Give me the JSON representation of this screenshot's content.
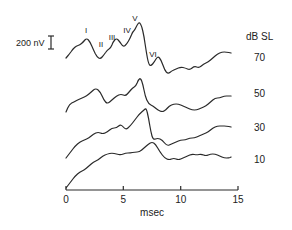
{
  "chart_data": {
    "type": "line",
    "title": "",
    "xlabel": "msec",
    "ylabel": "",
    "xlim": [
      0,
      15
    ],
    "x_ticks": [
      0,
      5,
      10,
      15
    ],
    "x_tick_labels": [
      "0",
      "5",
      "10",
      "15"
    ],
    "grid": false,
    "scale_bar": {
      "label": "200 nV",
      "value_nV": 200
    },
    "legend_title": "dB SL",
    "series": [
      {
        "name": "70",
        "level_db_sl": 70,
        "points": [
          [
            0.0,
            58
          ],
          [
            0.3,
            54
          ],
          [
            0.6,
            49
          ],
          [
            0.9,
            46
          ],
          [
            1.2,
            45
          ],
          [
            1.5,
            42
          ],
          [
            1.8,
            38
          ],
          [
            2.1,
            42
          ],
          [
            2.4,
            50
          ],
          [
            2.7,
            57
          ],
          [
            3.0,
            59
          ],
          [
            3.3,
            55
          ],
          [
            3.6,
            50
          ],
          [
            3.9,
            48
          ],
          [
            4.1,
            42
          ],
          [
            4.4,
            38
          ],
          [
            4.7,
            42
          ],
          [
            5.0,
            47
          ],
          [
            5.3,
            44
          ],
          [
            5.6,
            38
          ],
          [
            5.8,
            32
          ],
          [
            6.0,
            30
          ],
          [
            6.2,
            25
          ],
          [
            6.4,
            22
          ],
          [
            6.6,
            26
          ],
          [
            6.8,
            36
          ],
          [
            7.0,
            52
          ],
          [
            7.2,
            64
          ],
          [
            7.4,
            66
          ],
          [
            7.7,
            62
          ],
          [
            8.0,
            56
          ],
          [
            8.3,
            60
          ],
          [
            8.6,
            70
          ],
          [
            8.9,
            74
          ],
          [
            9.2,
            71
          ],
          [
            9.6,
            69
          ],
          [
            10.0,
            67
          ],
          [
            10.4,
            68
          ],
          [
            10.8,
            70
          ],
          [
            11.2,
            66
          ],
          [
            11.6,
            68
          ],
          [
            12.0,
            64
          ],
          [
            12.4,
            62
          ],
          [
            12.8,
            58
          ],
          [
            13.2,
            54
          ],
          [
            13.6,
            52
          ],
          [
            14.0,
            52
          ],
          [
            14.4,
            53
          ]
        ]
      },
      {
        "name": "50",
        "level_db_sl": 50,
        "points": [
          [
            0.0,
            112
          ],
          [
            0.3,
            104
          ],
          [
            0.7,
            102
          ],
          [
            1.0,
            100
          ],
          [
            1.4,
            98
          ],
          [
            1.8,
            96
          ],
          [
            2.2,
            92
          ],
          [
            2.6,
            88
          ],
          [
            3.0,
            92
          ],
          [
            3.3,
            100
          ],
          [
            3.6,
            104
          ],
          [
            4.0,
            100
          ],
          [
            4.4,
            96
          ],
          [
            4.8,
            94
          ],
          [
            5.2,
            96
          ],
          [
            5.5,
            92
          ],
          [
            5.8,
            88
          ],
          [
            6.1,
            86
          ],
          [
            6.3,
            80
          ],
          [
            6.5,
            78
          ],
          [
            6.7,
            84
          ],
          [
            6.9,
            96
          ],
          [
            7.2,
            104
          ],
          [
            7.6,
            106
          ],
          [
            8.0,
            110
          ],
          [
            8.4,
            112
          ],
          [
            8.7,
            110
          ],
          [
            9.0,
            106
          ],
          [
            9.4,
            104
          ],
          [
            9.8,
            104
          ],
          [
            10.2,
            106
          ],
          [
            10.6,
            108
          ],
          [
            11.0,
            110
          ],
          [
            11.4,
            110
          ],
          [
            11.8,
            108
          ],
          [
            12.2,
            106
          ],
          [
            12.6,
            102
          ],
          [
            13.0,
            98
          ],
          [
            13.4,
            98
          ],
          [
            13.8,
            96
          ],
          [
            14.2,
            96
          ],
          [
            14.4,
            96
          ]
        ]
      },
      {
        "name": "30",
        "level_db_sl": 30,
        "points": [
          [
            0.0,
            158
          ],
          [
            0.4,
            152
          ],
          [
            0.8,
            146
          ],
          [
            1.2,
            142
          ],
          [
            1.6,
            140
          ],
          [
            2.0,
            138
          ],
          [
            2.4,
            134
          ],
          [
            2.8,
            132
          ],
          [
            3.2,
            134
          ],
          [
            3.6,
            132
          ],
          [
            4.0,
            128
          ],
          [
            4.4,
            128
          ],
          [
            4.8,
            124
          ],
          [
            5.2,
            130
          ],
          [
            5.6,
            126
          ],
          [
            6.0,
            120
          ],
          [
            6.4,
            114
          ],
          [
            6.8,
            110
          ],
          [
            7.0,
            108
          ],
          [
            7.2,
            118
          ],
          [
            7.4,
            132
          ],
          [
            7.6,
            140
          ],
          [
            8.0,
            138
          ],
          [
            8.4,
            140
          ],
          [
            8.8,
            146
          ],
          [
            9.2,
            144
          ],
          [
            9.6,
            142
          ],
          [
            10.0,
            140
          ],
          [
            10.4,
            140
          ],
          [
            10.8,
            138
          ],
          [
            11.2,
            138
          ],
          [
            11.6,
            136
          ],
          [
            12.0,
            134
          ],
          [
            12.4,
            132
          ],
          [
            12.8,
            128
          ],
          [
            13.2,
            126
          ],
          [
            13.6,
            126
          ],
          [
            14.0,
            126
          ],
          [
            14.4,
            127
          ]
        ]
      },
      {
        "name": "10",
        "level_db_sl": 10,
        "points": [
          [
            0.0,
            188
          ],
          [
            0.4,
            182
          ],
          [
            0.8,
            176
          ],
          [
            1.2,
            172
          ],
          [
            1.6,
            170
          ],
          [
            2.0,
            166
          ],
          [
            2.4,
            162
          ],
          [
            2.8,
            160
          ],
          [
            3.2,
            156
          ],
          [
            3.6,
            154
          ],
          [
            4.0,
            153
          ],
          [
            4.4,
            154
          ],
          [
            4.8,
            155
          ],
          [
            5.2,
            153
          ],
          [
            5.6,
            153
          ],
          [
            6.0,
            152
          ],
          [
            6.4,
            152
          ],
          [
            6.8,
            148
          ],
          [
            7.2,
            144
          ],
          [
            7.5,
            142
          ],
          [
            7.8,
            144
          ],
          [
            8.2,
            152
          ],
          [
            8.6,
            158
          ],
          [
            9.0,
            160
          ],
          [
            9.4,
            158
          ],
          [
            9.8,
            160
          ],
          [
            10.2,
            158
          ],
          [
            10.6,
            156
          ],
          [
            11.0,
            154
          ],
          [
            11.4,
            155
          ],
          [
            11.8,
            154
          ],
          [
            12.2,
            156
          ],
          [
            12.6,
            154
          ],
          [
            13.0,
            154
          ],
          [
            13.4,
            156
          ],
          [
            13.8,
            158
          ],
          [
            14.2,
            158
          ],
          [
            14.4,
            157
          ]
        ]
      }
    ],
    "peak_labels": [
      {
        "label": "I",
        "x_ms": 1.8
      },
      {
        "label": "II",
        "x_ms": 3.3
      },
      {
        "label": "III",
        "x_ms": 4.2
      },
      {
        "label": "IV",
        "x_ms": 5.4
      },
      {
        "label": "V",
        "x_ms": 6.4
      },
      {
        "label": "VI",
        "x_ms": 8.9
      }
    ]
  },
  "labels": {
    "scale_bar": "200 nV",
    "legend_title": "dB SL",
    "level_70": "70",
    "level_50": "50",
    "level_30": "30",
    "level_10": "10",
    "xlabel": "msec",
    "tick_0": "0",
    "tick_5": "5",
    "tick_10": "10",
    "tick_15": "15",
    "peak_I": "I",
    "peak_II": "II",
    "peak_III": "III",
    "peak_IV": "IV",
    "peak_V": "V",
    "peak_VI": "VI"
  }
}
